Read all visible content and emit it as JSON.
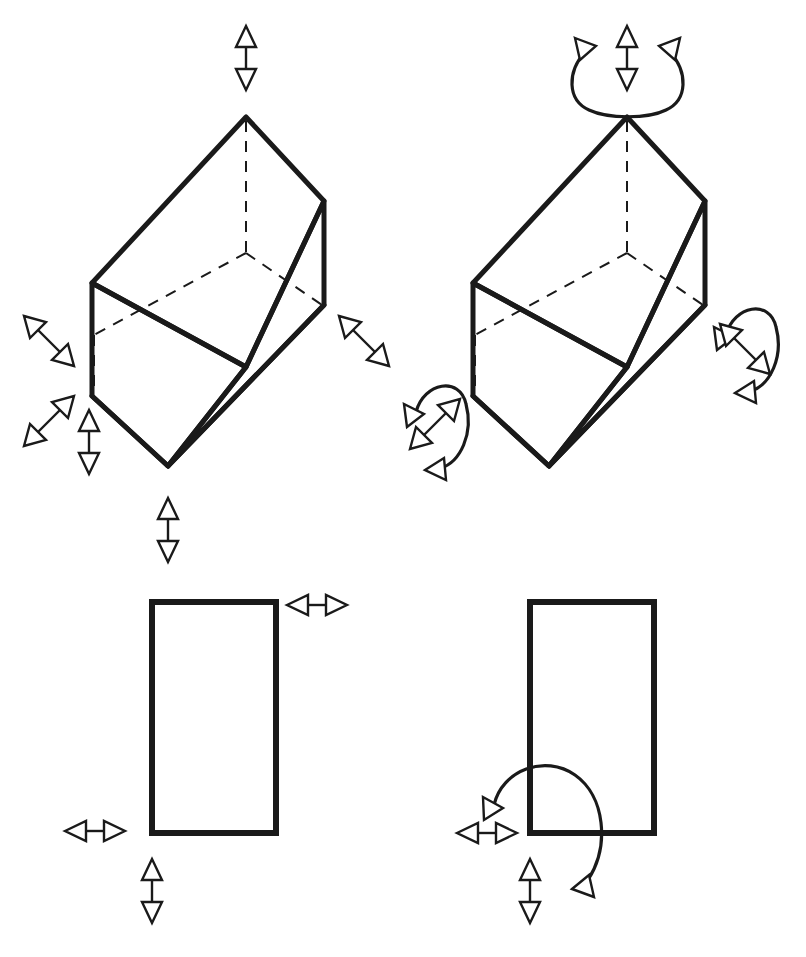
{
  "figure": {
    "background_color": "#ffffff",
    "line_color": "#1a1a1a",
    "arrow_fill": "#ffffff",
    "width": 806,
    "height": 957
  },
  "panels": [
    {
      "id": "top-left",
      "shape": "isometric-box-3d",
      "shape_label": "3D rectangular box, isometric view",
      "motion_type": "translation-only",
      "arrow_count": 6,
      "arc_count": 0
    },
    {
      "id": "top-right",
      "shape": "isometric-box-3d",
      "shape_label": "3D rectangular box, isometric view",
      "motion_type": "translation-and-rotation",
      "arrow_count": 3,
      "arc_count": 3
    },
    {
      "id": "bottom-left",
      "shape": "rectangle-2d",
      "shape_label": "2D rectangle, front view",
      "motion_type": "translation-only",
      "arrow_count": 3,
      "arc_count": 0
    },
    {
      "id": "bottom-right",
      "shape": "rectangle-2d",
      "shape_label": "2D rectangle, front view",
      "motion_type": "translation-and-rotation",
      "arrow_count": 2,
      "arc_count": 1
    }
  ],
  "boxes": {
    "top_left": {
      "top_apex": [
        246,
        117
      ],
      "top_left_corner": [
        92,
        283
      ],
      "top_right_corner": [
        324,
        201
      ],
      "top_back_corner": [
        246,
        253
      ],
      "bottom_apex": [
        168,
        466
      ],
      "bottom_left_corner": [
        92,
        396
      ],
      "bottom_right_corner": [
        324,
        305
      ],
      "bottom_back_corner": [
        246,
        253
      ]
    },
    "top_right": {
      "top_apex": [
        627,
        117
      ],
      "top_left_corner": [
        473,
        283
      ],
      "top_right_corner": [
        705,
        201
      ],
      "bottom_apex": [
        549,
        466
      ],
      "bottom_left_corner": [
        473,
        396
      ],
      "bottom_right_corner": [
        705,
        305
      ]
    }
  },
  "rects": {
    "bottom_left": {
      "x": 152,
      "y": 602,
      "width": 124,
      "height": 231
    },
    "bottom_right": {
      "x": 530,
      "y": 602,
      "width": 124,
      "height": 231
    }
  },
  "arrows": {
    "top_left_panel": [
      {
        "name": "vertical-up-top",
        "direction": "vertical",
        "cx": 246,
        "cy": 57
      },
      {
        "name": "diagonal-left-upper",
        "direction": "diagonal-nwse",
        "cx": 48,
        "cy": 340
      },
      {
        "name": "diagonal-left-lower",
        "direction": "diagonal-nesw",
        "cx": 48,
        "cy": 420
      },
      {
        "name": "vertical-left-lower",
        "direction": "vertical",
        "cx": 89,
        "cy": 441
      },
      {
        "name": "diagonal-right",
        "direction": "diagonal-nwse",
        "cx": 363,
        "cy": 340
      },
      {
        "name": "vertical-bottom",
        "direction": "vertical",
        "cx": 168,
        "cy": 529
      }
    ],
    "top_right_panel": [
      {
        "name": "vertical-top-center",
        "direction": "vertical",
        "cx": 627,
        "cy": 57
      },
      {
        "name": "diagonal-left",
        "direction": "diagonal-nesw",
        "cx": 434,
        "cy": 425
      },
      {
        "name": "diagonal-right",
        "direction": "diagonal-nwse",
        "cx": 744,
        "cy": 348
      }
    ],
    "bottom_left_panel": [
      {
        "name": "horizontal-top-right",
        "direction": "horizontal",
        "cx": 317,
        "cy": 605
      },
      {
        "name": "horizontal-left",
        "direction": "horizontal",
        "cx": 95,
        "cy": 831
      },
      {
        "name": "vertical-bottom",
        "direction": "vertical",
        "cx": 152,
        "cy": 890
      }
    ],
    "bottom_right_panel": [
      {
        "name": "horizontal-left",
        "direction": "horizontal",
        "cx": 487,
        "cy": 833
      },
      {
        "name": "vertical-bottom",
        "direction": "vertical",
        "cx": 530,
        "cy": 890
      }
    ]
  },
  "arcs": {
    "top_right_vertical_axis": {
      "name": "rotation-arc-vertical-axis",
      "orientation": "open-top-u-shape"
    },
    "top_right_left_face": {
      "name": "rotation-arc-left-face",
      "orientation": "open-left"
    },
    "top_right_right_face": {
      "name": "rotation-arc-right-face",
      "orientation": "open-left"
    },
    "bottom_right_corner": {
      "name": "rotation-arc-corner",
      "orientation": "quarter-turn-around-corner"
    }
  }
}
